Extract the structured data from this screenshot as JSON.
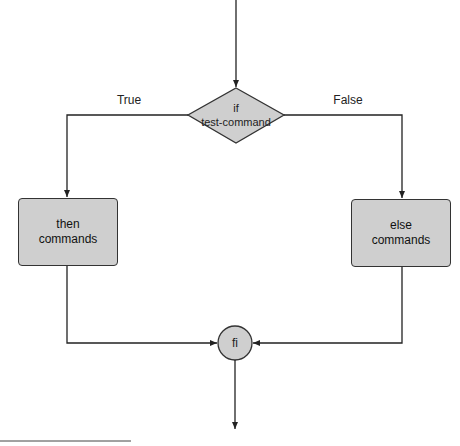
{
  "diagram": {
    "type": "flowchart",
    "decision": {
      "line1": "if",
      "line2": "test-command"
    },
    "branches": {
      "true_label": "True",
      "false_label": "False"
    },
    "then_box": {
      "line1": "then",
      "line2": "commands"
    },
    "else_box": {
      "line1": "else",
      "line2": "commands"
    },
    "merge_node": {
      "label": "fi"
    }
  },
  "colors": {
    "shape_fill": "#cfcfcf",
    "stroke": "#333333",
    "background": "#ffffff"
  }
}
